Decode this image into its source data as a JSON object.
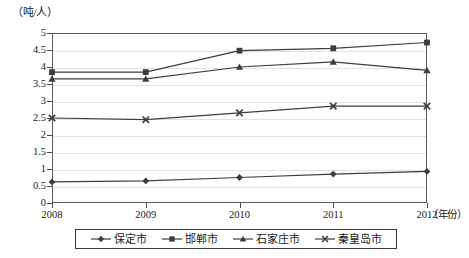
{
  "chart_data": {
    "type": "line",
    "title": "",
    "xlabel": "年份",
    "ylabel": "吨/人",
    "y_unit_label": "（吨/人）",
    "x_unit_label": "（年份）",
    "categories": [
      "2008",
      "2009",
      "2010",
      "2011",
      "2012"
    ],
    "x": [
      2008,
      2009,
      2010,
      2011,
      2012
    ],
    "ylim": [
      0,
      5
    ],
    "ytick_step": 0.5,
    "yticks": [
      "0",
      "0.5",
      "1",
      "1.5",
      "2",
      "2.5",
      "3",
      "3.5",
      "4",
      "4.5",
      "5"
    ],
    "ytick_values": [
      0,
      0.5,
      1,
      1.5,
      2,
      2.5,
      3,
      3.5,
      4,
      4.5,
      5
    ],
    "grid": true,
    "grid_axis": "y",
    "legend_position": "bottom",
    "series": [
      {
        "name": "保定市",
        "marker": "diamond",
        "values": [
          0.62,
          0.65,
          0.75,
          0.85,
          0.93
        ]
      },
      {
        "name": "邯郸市",
        "marker": "square",
        "values": [
          3.85,
          3.85,
          4.48,
          4.55,
          4.72
        ]
      },
      {
        "name": "石家庄市",
        "marker": "triangle",
        "values": [
          3.65,
          3.65,
          4.0,
          4.15,
          3.9
        ]
      },
      {
        "name": "秦皇岛市",
        "marker": "x",
        "values": [
          2.5,
          2.45,
          2.65,
          2.85,
          2.85
        ]
      }
    ],
    "colors": {
      "series_line": "#3d3d3d",
      "grid": "#e2e2e2",
      "frame": "#5c5c5c",
      "text": "#1a1a1a"
    }
  }
}
